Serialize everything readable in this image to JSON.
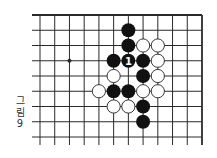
{
  "diagram": {
    "type": "go-board",
    "caption": [
      "그",
      "림",
      "9"
    ],
    "grid": {
      "columns": 12,
      "rows": 9,
      "x0": 40,
      "y0": 15,
      "dx": 14.727,
      "dy": 15.25,
      "open_left": true,
      "open_bottom": true,
      "edge_top": true,
      "edge_right": true
    },
    "star_points": [
      [
        2,
        3
      ]
    ],
    "stones": [
      {
        "color": "black",
        "col": 6,
        "row": 1
      },
      {
        "color": "black",
        "col": 6,
        "row": 2
      },
      {
        "color": "white",
        "col": 7,
        "row": 2
      },
      {
        "color": "white",
        "col": 8,
        "row": 2
      },
      {
        "color": "black",
        "col": 5,
        "row": 3
      },
      {
        "color": "black",
        "col": 6,
        "row": 3,
        "label": "1"
      },
      {
        "color": "black",
        "col": 7,
        "row": 3
      },
      {
        "color": "white",
        "col": 8,
        "row": 3
      },
      {
        "color": "white",
        "col": 5,
        "row": 4
      },
      {
        "color": "black",
        "col": 7,
        "row": 4
      },
      {
        "color": "white",
        "col": 8,
        "row": 4
      },
      {
        "color": "white",
        "col": 4,
        "row": 5
      },
      {
        "color": "black",
        "col": 5,
        "row": 5
      },
      {
        "color": "black",
        "col": 6,
        "row": 5
      },
      {
        "color": "white",
        "col": 7,
        "row": 5
      },
      {
        "color": "white",
        "col": 8,
        "row": 5
      },
      {
        "color": "white",
        "col": 5,
        "row": 6
      },
      {
        "color": "white",
        "col": 6,
        "row": 6
      },
      {
        "color": "black",
        "col": 7,
        "row": 6
      },
      {
        "color": "black",
        "col": 7,
        "row": 7
      }
    ],
    "colors": {
      "line": "#2a2a2a",
      "black_stone": "#111111",
      "white_stone_fill": "#ffffff",
      "white_stone_stroke": "#222222",
      "label_on_black": "#ffffff",
      "background": "#ffffff"
    }
  }
}
